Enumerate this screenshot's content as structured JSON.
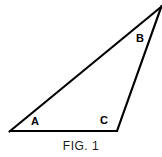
{
  "figure": {
    "caption": "FIG. 1",
    "background_color": "#ffffff",
    "stroke_color": "#000000",
    "stroke_width": 2,
    "width": 162,
    "height": 157,
    "labels": {
      "a": "A",
      "b": "B",
      "c": "C"
    },
    "vertices": {
      "a": {
        "x": 10,
        "y": 131
      },
      "c": {
        "x": 117,
        "y": 131
      },
      "apex": {
        "x": 161,
        "y": 7
      }
    },
    "edges": [
      {
        "name": "base-a-to-c",
        "from": "a",
        "to": "c"
      },
      {
        "name": "long-side-a-to-apex",
        "from": "a",
        "to": "apex"
      },
      {
        "name": "right-side-c-to-apex",
        "from": "c",
        "to": "apex"
      }
    ]
  }
}
